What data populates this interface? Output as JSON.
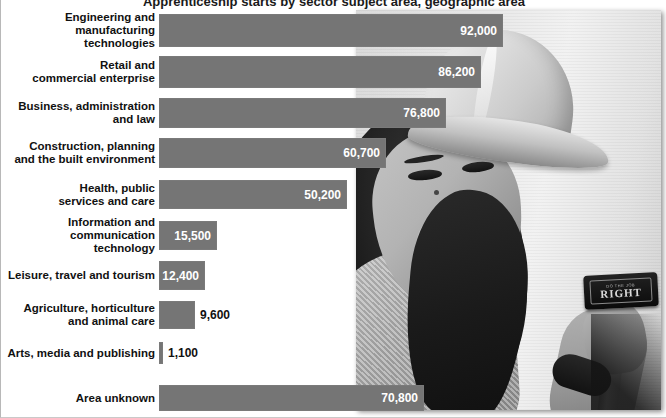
{
  "chart_data": {
    "type": "bar",
    "orientation": "horizontal",
    "title": "Apprenticeship starts by sector subject area, geographic area",
    "xlabel": "",
    "ylabel": "",
    "grid": false,
    "legend": "none",
    "value_format": "comma-separated integers",
    "xlim": [
      0,
      92000
    ],
    "categories": [
      "Engineering and\nmanufacturing\ntechnologies",
      "Retail and\ncommercial enterprise",
      "Business, administration\nand law",
      "Construction, planning\nand the built environment",
      "Health, public\nservices and care",
      "Information and\ncommunication\ntechnology",
      "Leisure, travel and tourism",
      "Agriculture, horticulture\nand animal care",
      "Arts, media and publishing",
      "Area unknown"
    ],
    "values": [
      92000,
      86200,
      76800,
      60700,
      50200,
      15500,
      12400,
      9600,
      1100,
      70800
    ],
    "value_labels": [
      "92,000",
      "86,200",
      "76,800",
      "60,700",
      "50,200",
      "15,500",
      "12,400",
      "9,600",
      "1,100",
      "70,800"
    ],
    "bar_color": "#757575",
    "label_color_inside": "#ffffff",
    "label_color_outside": "#111111",
    "background_color": "#ffffff"
  },
  "photo": {
    "alt_name": "woman-in-hard-hat-holding-tool",
    "tool_label_top": "DO THE JOB",
    "tool_label_word": "RIGHT"
  }
}
